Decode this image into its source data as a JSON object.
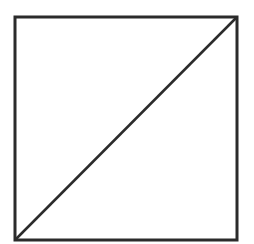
{
  "diagram": {
    "shapes": [
      {
        "type": "square",
        "x1": 15,
        "y1": 17,
        "x2": 237,
        "y2": 240
      },
      {
        "type": "diagonal-line",
        "from": [
          15,
          240
        ],
        "to": [
          237,
          17
        ]
      }
    ],
    "stroke_color": "#2b2b2b",
    "background": "#ffffff"
  }
}
